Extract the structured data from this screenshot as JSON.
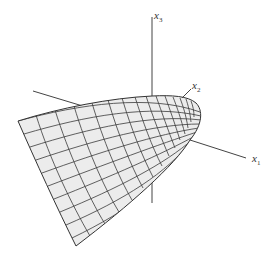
{
  "figure": {
    "surface_fill": "#ececec",
    "mesh_color": "#3a3a3a",
    "axis_color": "#444444",
    "axes": [
      {
        "name": "x1",
        "label": "x",
        "subscript": "1"
      },
      {
        "name": "x2",
        "label": "x",
        "subscript": "2"
      },
      {
        "name": "x3",
        "label": "x",
        "subscript": "3"
      }
    ]
  }
}
